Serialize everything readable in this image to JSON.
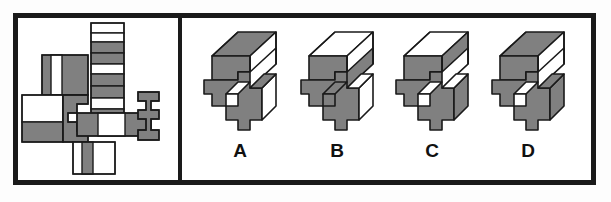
{
  "figure": {
    "kind": "spatial-reasoning-block-rotation",
    "frame_color": "#1a1a1a",
    "background_color": "#ffffff",
    "face_shade_color": "#808080",
    "face_light_color": "#ffffff",
    "outline_color": "#1a1a1a"
  },
  "left_panel": {
    "name": "pattern-net",
    "description": "Unfolded 2D net made of gray and white rectangular and stepped faces",
    "pieces": [
      {
        "id": "vertical-strip",
        "kind": "striped-column",
        "stripes": [
          "white",
          "white",
          "gray",
          "gray",
          "white",
          "gray",
          "gray",
          "white",
          "gray"
        ]
      },
      {
        "id": "upper-left-face",
        "kind": "gray-with-white-band"
      },
      {
        "id": "left-face",
        "kind": "white-with-gray-band"
      },
      {
        "id": "center-step-face",
        "kind": "gray-stepped"
      },
      {
        "id": "center-bar-face",
        "kind": "gray-white-bar"
      },
      {
        "id": "right-step-face",
        "kind": "gray-stepped"
      },
      {
        "id": "bottom-face",
        "kind": "white-with-gray-band"
      }
    ]
  },
  "right_panel": {
    "name": "answer-options",
    "options": [
      {
        "label": "A",
        "top_face": "gray",
        "notch_face": "white"
      },
      {
        "label": "B",
        "top_face": "white",
        "notch_face": "gray"
      },
      {
        "label": "C",
        "top_face": "white",
        "notch_face": "white"
      },
      {
        "label": "D",
        "top_face": "gray",
        "notch_face": "white"
      }
    ]
  }
}
